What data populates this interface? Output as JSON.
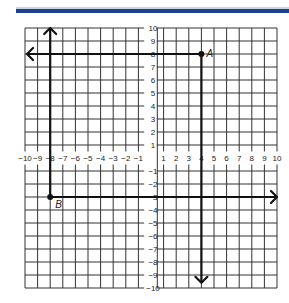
{
  "header": {
    "bar_color": "#1f3f8f"
  },
  "chart_data": {
    "type": "scatter",
    "title": "",
    "xlabel": "",
    "ylabel": "",
    "xlim": [
      -10,
      10
    ],
    "ylim": [
      -10,
      10
    ],
    "grid": true,
    "x_tick_labels": [
      "-10",
      "-9",
      "-8",
      "-7",
      "-6",
      "-5",
      "-4",
      "-3",
      "-2",
      "-1",
      "1",
      "2",
      "3",
      "4",
      "5",
      "6",
      "7",
      "8",
      "9",
      "10"
    ],
    "y_tick_labels": [
      "10",
      "9",
      "8",
      "7",
      "6",
      "5",
      "4",
      "3",
      "2",
      "1",
      "-1",
      "-2",
      "-3",
      "-4",
      "-5",
      "-6",
      "-7",
      "-8",
      "-9",
      "-10"
    ],
    "points": [
      {
        "label": "A",
        "x": 4,
        "y": 8
      },
      {
        "label": "B",
        "x": -8,
        "y": -3
      }
    ],
    "lines": [
      {
        "name": "horizontal-through-A",
        "y": 8,
        "from_x": 4,
        "to_x": -10,
        "arrow": "left"
      },
      {
        "name": "vertical-through-A",
        "x": 4,
        "from_y": 8,
        "to_y": -9.6,
        "arrow": "down"
      },
      {
        "name": "vertical-through-B",
        "x": -8,
        "from_y": -3,
        "to_y": 10,
        "arrow": "up"
      },
      {
        "name": "horizontal-through-B",
        "y": -3,
        "from_x": -8,
        "to_x": 10,
        "arrow": "right"
      }
    ]
  }
}
